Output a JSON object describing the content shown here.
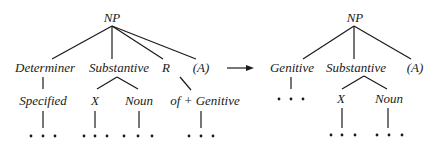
{
  "left_tree": {
    "root": "NP",
    "level1": [
      "Determiner",
      "Substantive",
      "R",
      "(A)"
    ],
    "level2": {
      "specified": "Specified",
      "x": "X",
      "noun": "Noun",
      "of_genitive": "of + Genitive"
    },
    "ellipsis": "• • •"
  },
  "arrow": "transforms-to",
  "right_tree": {
    "root": "NP",
    "level1": [
      "Genitive",
      "Substantive",
      "(A)"
    ],
    "level2": {
      "x": "X",
      "noun": "Noun"
    },
    "ellipsis": "• • •"
  }
}
